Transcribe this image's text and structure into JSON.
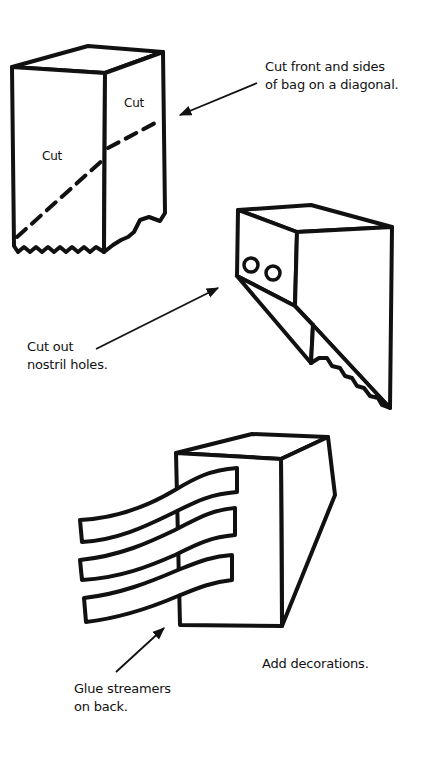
{
  "illustration": {
    "steps": [
      {
        "id": "step-1",
        "caption": [
          "Cut front and sides",
          "of bag on a diagonal."
        ],
        "bag_labels": {
          "front": "Cut",
          "side": "Cut"
        }
      },
      {
        "id": "step-2",
        "caption": [
          "Cut out",
          "nostril holes."
        ]
      },
      {
        "id": "step-3",
        "caption": [
          "Glue streamers",
          "on back."
        ],
        "extra_caption": "Add decorations."
      }
    ],
    "colors": {
      "ink": "#111111",
      "paper": "#ffffff"
    }
  }
}
